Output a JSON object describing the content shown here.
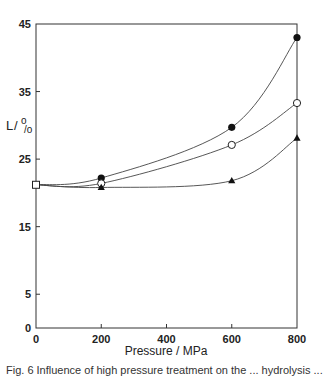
{
  "chart_data": {
    "type": "line",
    "title": "",
    "xlabel": "Pressure / MPa",
    "ylabel": "L / %",
    "xlim": [
      0,
      800
    ],
    "ylim": [
      0,
      45
    ],
    "x_ticks": [
      0,
      200,
      400,
      600,
      800
    ],
    "x_tick_labels": [
      "0",
      "200",
      "400",
      "600",
      "800"
    ],
    "y_ticks": [
      0,
      5,
      15,
      25,
      35,
      45
    ],
    "y_tick_labels": [
      "0",
      "5",
      "15",
      "25",
      "35",
      "45"
    ],
    "grid": false,
    "legend": null,
    "x": [
      0,
      200,
      600,
      800
    ],
    "series": [
      {
        "name": "filled-circle",
        "marker": "filled circle",
        "values": [
          21.2,
          22.2,
          29.7,
          43.0
        ]
      },
      {
        "name": "open-circle",
        "marker": "open circle",
        "values": [
          21.2,
          21.4,
          27.1,
          33.3
        ]
      },
      {
        "name": "filled-triangle",
        "marker": "filled triangle",
        "values": [
          21.2,
          20.8,
          21.8,
          28.1
        ]
      }
    ],
    "annotations": [
      "Shared starting point at 0 MPa drawn as open square"
    ]
  },
  "caption": "Fig. 6  Influence of high pressure treatment on the ... hydrolysis ..."
}
